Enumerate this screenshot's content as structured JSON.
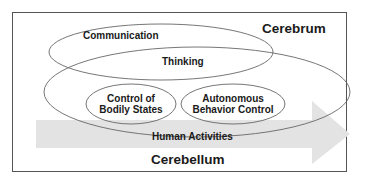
{
  "diagram": {
    "regions": {
      "cerebrum": "Cerebrum",
      "cerebellum": "Cerebellum"
    },
    "ellipses": {
      "communication": "Communication",
      "thinking": "Thinking",
      "control_bodily_line1": "Control of",
      "control_bodily_line2": "Bodily States",
      "autonomous_line1": "Autonomous",
      "autonomous_line2": "Behavior Control"
    },
    "arrow": {
      "label": "Human Activities"
    },
    "colors": {
      "frame": "#555555",
      "ellipse_stroke": "#666666",
      "arrow_fill": "#e3e3e3",
      "text": "#1a1a1a"
    }
  }
}
